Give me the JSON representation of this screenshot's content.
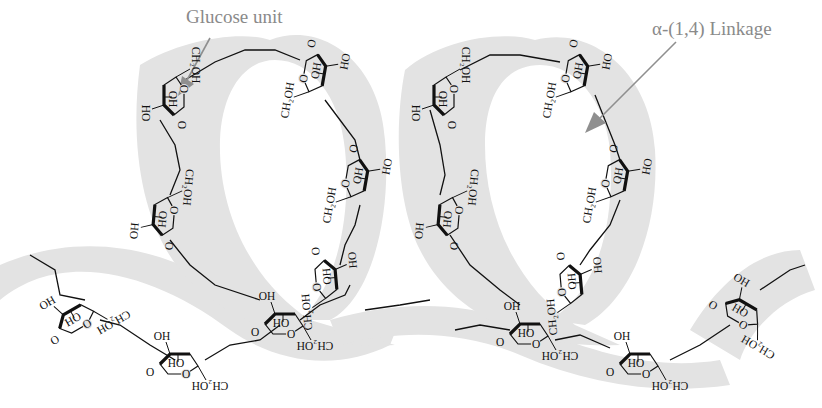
{
  "diagram": {
    "labels": {
      "glucose_unit": "Glucose unit",
      "linkage": "α-(1,4) Linkage"
    },
    "colors": {
      "ribbon": "#e2e2e2",
      "ribbon_dark": "#d6d6d6",
      "label_text": "#8a8a8a",
      "arrow": "#8f8f8f",
      "bond": "#111111"
    },
    "atoms": {
      "oxygen": "O",
      "hydroxyl": "OH",
      "hydroxyl_rev": "HO",
      "hydroxymethyl": "CH₂OH",
      "hydroxymethyl_rev": "HOH₂C"
    },
    "helix_turns": 2,
    "glucose_units": [
      {
        "id": 1,
        "x": 170,
        "y": 95,
        "rot": 90
      },
      {
        "id": 2,
        "x": 318,
        "y": 75,
        "rot": -80
      },
      {
        "id": 3,
        "x": 360,
        "y": 180,
        "rot": -80
      },
      {
        "id": 4,
        "x": 330,
        "y": 280,
        "rot": -95
      },
      {
        "id": 5,
        "x": 160,
        "y": 215,
        "rot": 95
      },
      {
        "id": 6,
        "x": 75,
        "y": 315,
        "rot": 150
      },
      {
        "id": 7,
        "x": 180,
        "y": 360,
        "rot": 180
      },
      {
        "id": 8,
        "x": 285,
        "y": 320,
        "rot": 180
      },
      {
        "id": 9,
        "x": 440,
        "y": 95,
        "rot": 90
      },
      {
        "id": 10,
        "x": 580,
        "y": 75,
        "rot": -80
      },
      {
        "id": 11,
        "x": 620,
        "y": 180,
        "rot": -80
      },
      {
        "id": 12,
        "x": 575,
        "y": 285,
        "rot": -95
      },
      {
        "id": 13,
        "x": 445,
        "y": 215,
        "rot": 95
      },
      {
        "id": 14,
        "x": 530,
        "y": 330,
        "rot": 180
      },
      {
        "id": 15,
        "x": 640,
        "y": 360,
        "rot": 180
      },
      {
        "id": 16,
        "x": 745,
        "y": 310,
        "rot": 210
      }
    ]
  }
}
